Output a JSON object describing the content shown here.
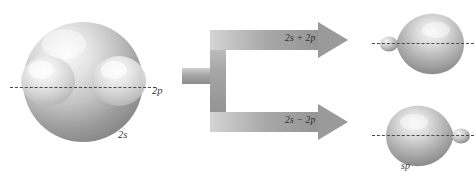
{
  "figure": {
    "background_color": "#ffffff",
    "width": 476,
    "height": 183
  },
  "left_orbital": {
    "sphere_label": "2s",
    "lobes_label": "2p",
    "axis_style": "dashed",
    "description": "2s spherical orbital superimposed on a two-lobed 2p orbital"
  },
  "transformation": {
    "top_arrow_label": "2s + 2p",
    "bottom_arrow_label": "2s − 2p",
    "arrow_color": "#9a9a9a"
  },
  "right_orbitals": [
    {
      "name": "sp-hybrid-top",
      "label": "",
      "large_lobe_direction": "right",
      "small_lobe_direction": "left"
    },
    {
      "name": "sp-hybrid-bottom",
      "label": "sp",
      "large_lobe_direction": "left",
      "small_lobe_direction": "right"
    }
  ],
  "colors": {
    "orbital_light": "#f2f2f2",
    "orbital_mid": "#c2c2c2",
    "orbital_dark": "#8a8a8a",
    "axis": "#4a4a4a",
    "text": "#2e2e2e"
  }
}
